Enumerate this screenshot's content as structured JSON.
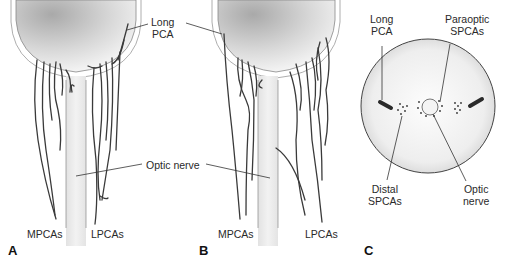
{
  "figure": {
    "panels": [
      {
        "id": "A",
        "letter": "A",
        "labels": {
          "mpcas": "MPCAs",
          "lpcas": "LPCAs"
        }
      },
      {
        "id": "B",
        "letter": "B",
        "labels": {
          "mpcas": "MPCAs",
          "lpcas": "LPCAs"
        }
      },
      {
        "id": "C",
        "letter": "C",
        "labels": {
          "long_pca_line1": "Long",
          "long_pca_line2": "PCA",
          "paraoptic_line1": "Paraoptic",
          "paraoptic_line2": "SPCAs",
          "distal_line1": "Distal",
          "distal_line2": "SPCAs",
          "optic_line1": "Optic",
          "optic_line2": "nerve"
        }
      }
    ],
    "shared_labels": {
      "long_pca_line1": "Long",
      "long_pca_line2": "PCA",
      "optic_nerve": "Optic nerve"
    },
    "colors": {
      "vessel": "#3a3a3a",
      "globe_dark": "#b8b8b8",
      "globe_light": "#f4f4f4",
      "nerve": "#e6e6e6",
      "leader": "#333333"
    }
  }
}
